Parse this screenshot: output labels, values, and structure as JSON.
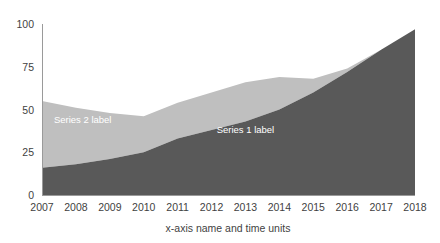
{
  "chart_data": {
    "type": "area",
    "stacked": true,
    "title": "",
    "xlabel": "x-axis name and time units",
    "ylabel": "",
    "categories": [
      "2007",
      "2008",
      "2009",
      "2010",
      "2011",
      "2012",
      "2013",
      "2014",
      "2015",
      "2016",
      "2017",
      "2018"
    ],
    "x": [
      2007,
      2008,
      2009,
      2010,
      2011,
      2012,
      2013,
      2014,
      2015,
      2016,
      2017,
      2018
    ],
    "series": [
      {
        "name": "Series 1 label",
        "color": "#595959",
        "values": [
          16,
          18,
          21,
          25,
          33,
          38,
          43,
          50,
          60,
          72,
          85,
          97
        ]
      },
      {
        "name": "Series 2 label",
        "color": "#bfbfbf",
        "values": [
          39,
          33,
          27,
          21,
          21,
          22,
          23,
          19,
          8,
          2,
          0,
          0
        ]
      }
    ],
    "totals": [
      55,
      51,
      48,
      46,
      54,
      60,
      66,
      69,
      68,
      74,
      85,
      97
    ],
    "ylim": [
      0,
      100
    ],
    "yticks": [
      0,
      25,
      50,
      75,
      100
    ],
    "ytick_labels": [
      "0",
      "25",
      "50",
      "75",
      "100"
    ],
    "grid": false,
    "legend": "inline-labels",
    "series_label_positions": [
      {
        "label": "Series 1 label",
        "x_year": 2013.0,
        "y_value": 36
      },
      {
        "label": "Series 2 label",
        "x_year": 2008.2,
        "y_value": 42
      }
    ],
    "axes": {
      "x_axis_color": "#9a9a9a",
      "y_axis_color": "#9a9a9a",
      "tick_text_color": "#3f3f3f"
    }
  },
  "plot": {
    "left": 42,
    "right": 415,
    "top": 24,
    "bottom": 195
  }
}
